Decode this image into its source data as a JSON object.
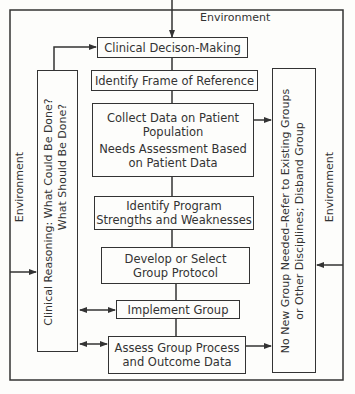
{
  "diagram": {
    "environment_label": "Environment",
    "boxes": {
      "decision": "Clinical Decison-Making",
      "frame": "Identify Frame of Reference",
      "collect_line1": "Collect Data on Patient",
      "collect_line2": "Population",
      "needs_line1": "Needs Assessment Based",
      "needs_line2": "on Patient Data",
      "program_line1": "Identify Program",
      "program_line2": "Strengths and Weaknesses",
      "protocol_line1": "Develop or Select",
      "protocol_line2": "Group Protocol",
      "implement": "Implement Group",
      "assess_line1": "Assess Group Process",
      "assess_line2": "and Outcome Data"
    },
    "left_box": {
      "line1": "Clinical Reasoning: What Could Be Done?",
      "line2": "What Should Be Done?"
    },
    "right_box": {
      "line1": "No New Group Needed–Refer to Existing Groups",
      "line2": "or Other Disciplines; Disband Group"
    },
    "colors": {
      "line": "#333333",
      "background": "#fdfdfb"
    }
  }
}
